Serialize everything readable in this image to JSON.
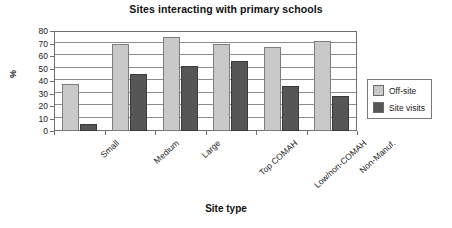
{
  "chart_data": {
    "type": "bar",
    "title": "Sites interacting with primary schools",
    "xlabel": "Site type",
    "ylabel": "%",
    "ylim": [
      0,
      80
    ],
    "ytick_step": 10,
    "yticks": [
      0,
      10,
      20,
      30,
      40,
      50,
      60,
      70,
      80
    ],
    "grid": true,
    "legend_position": "right",
    "categories": [
      "Small",
      "Medium",
      "Large",
      "Top COMAH",
      "Low/non-COMAH",
      "Non-Manuf."
    ],
    "series": [
      {
        "name": "Off-site",
        "color": "#c9c9c9",
        "values": [
          38,
          70,
          75,
          70,
          67,
          72
        ]
      },
      {
        "name": "Site visits",
        "color": "#565656",
        "values": [
          6,
          46,
          52,
          56,
          36,
          28
        ]
      }
    ]
  },
  "legend": {
    "entries": [
      {
        "label": "Off-site"
      },
      {
        "label": "Site visits"
      }
    ]
  }
}
